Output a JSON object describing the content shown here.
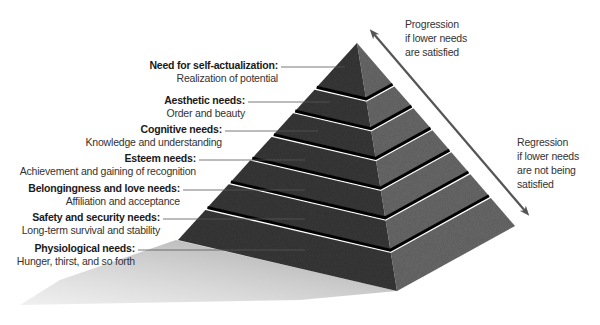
{
  "diagram": {
    "type": "hierarchy-pyramid",
    "apex": [
      357,
      43
    ],
    "base_left": [
      178,
      240
    ],
    "base_front": [
      397,
      291
    ],
    "base_right": [
      515,
      226
    ],
    "tier_breaks": [
      0,
      0.225,
      0.345,
      0.465,
      0.585,
      0.705,
      0.835,
      1.0
    ],
    "colors": {
      "left_face": "#3b3b3b",
      "right_face": "#6c6c6c",
      "groove": "#111111",
      "shadow": "#c8c8c8",
      "arrow": "#555555",
      "leader": "#555555"
    }
  },
  "levels": [
    {
      "title": "Need for self-actualization:",
      "subtitle": "Realization of potential",
      "right": 278,
      "top": 59,
      "line_y": 67,
      "line_end": 345
    },
    {
      "title": "Aesthetic needs:",
      "subtitle": "Order and beauty",
      "right": 245,
      "top": 94,
      "line_y": 102,
      "line_end": 330
    },
    {
      "title": "Cognitive needs:",
      "subtitle": "Knowledge and understanding",
      "right": 222,
      "top": 123,
      "line_y": 131,
      "line_end": 318
    },
    {
      "title": "Esteem needs:",
      "subtitle": "Achievement and gaining of recognition",
      "right": 196,
      "top": 152,
      "line_y": 160,
      "line_end": 305
    },
    {
      "title": "Belongingness and love needs:",
      "subtitle": "Affiliation and acceptance",
      "right": 180,
      "top": 182,
      "line_y": 190,
      "line_end": 305
    },
    {
      "title": "Safety and security needs:",
      "subtitle": "Long-term survival and stability",
      "right": 160,
      "top": 211,
      "line_y": 219,
      "line_end": 305
    },
    {
      "title": "Physiological needs:",
      "subtitle": "Hunger, thirst, and so forth",
      "right": 135,
      "top": 242,
      "line_y": 250,
      "line_end": 305
    }
  ],
  "progression": {
    "lines": [
      "Progression",
      "if lower needs",
      "are satisfied"
    ],
    "left": 405,
    "top": 17
  },
  "regression": {
    "lines": [
      "Regression",
      "if lower needs",
      "are not being",
      "satisfied"
    ],
    "left": 517,
    "top": 135
  },
  "arrow": {
    "from": [
      373,
      33
    ],
    "to": [
      526,
      212
    ]
  }
}
